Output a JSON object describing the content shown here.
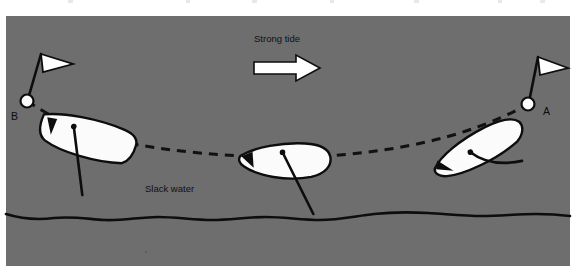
{
  "figure": {
    "name": "anchor-swing-tide-diagram",
    "panel": {
      "background_color": "#6e6e6e",
      "page_color": "#ffffff",
      "x": 6,
      "y": 16,
      "width": 564,
      "height": 250
    },
    "ink_color": "#0d0d0d",
    "hull_fill_color": "#fbfbfb"
  },
  "labels": {
    "tide": "Strong tide",
    "slack_water": "Slack water",
    "buoy_left": "B",
    "buoy_right": "A"
  },
  "chart_data": {
    "type": "diagram",
    "title": "Strong tide",
    "annotations": [
      "Strong tide",
      "Slack water",
      "B",
      "A"
    ],
    "tide_direction": "right",
    "swing_path": {
      "kind": "dashed-curve",
      "description": "Anchor swing arc from buoy B through slack water to buoy A",
      "points": [
        [
          27,
          101
        ],
        [
          118,
          140
        ],
        [
          200,
          152
        ],
        [
          290,
          157
        ],
        [
          380,
          150
        ],
        [
          466,
          131
        ],
        [
          528,
          104
        ]
      ]
    },
    "buoys": [
      {
        "id": "B",
        "x": 27,
        "y": 101,
        "flag_direction": "right",
        "label_x": 14,
        "label_y": 117
      },
      {
        "id": "A",
        "x": 528,
        "y": 104,
        "flag_direction": "right",
        "label_x": 546,
        "label_y": 113
      }
    ],
    "boats": [
      {
        "id": "boat-left",
        "position": "B",
        "x": 90,
        "y": 137,
        "heading_deg": -18,
        "length": 100
      },
      {
        "id": "boat-center",
        "position": "slack-water",
        "x": 285,
        "y": 160,
        "heading_deg": 0,
        "length": 92
      },
      {
        "id": "boat-right",
        "position": "A",
        "x": 478,
        "y": 135,
        "heading_deg": -22,
        "length": 100
      }
    ],
    "shoreline": {
      "kind": "wavy-line",
      "y": 216,
      "x_start": 6,
      "x_end": 570
    },
    "tide_arrow": {
      "x": 254,
      "y": 58,
      "width": 66,
      "height": 22,
      "direction": "right",
      "fill": "#ffffff",
      "stroke": "#0d0d0d"
    }
  }
}
